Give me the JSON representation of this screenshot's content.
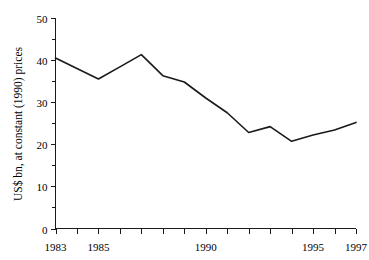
{
  "chart_data": {
    "type": "line",
    "title": "",
    "xlabel": "",
    "ylabel": "US$ bn, at constant (1990) prices",
    "x": [
      1983,
      1984,
      1985,
      1986,
      1987,
      1988,
      1989,
      1990,
      1991,
      1992,
      1993,
      1994,
      1995,
      1996,
      1997
    ],
    "values": [
      40.5,
      38.0,
      35.5,
      38.4,
      41.3,
      36.3,
      34.8,
      31.0,
      27.5,
      22.8,
      24.2,
      20.7,
      22.2,
      23.4,
      25.2
    ],
    "series": [
      {
        "name": "US$ bn, at constant (1990) prices",
        "values": [
          40.5,
          38.0,
          35.5,
          38.4,
          41.3,
          36.3,
          34.8,
          31.0,
          27.5,
          22.8,
          24.2,
          20.7,
          22.2,
          23.4,
          25.2
        ]
      }
    ],
    "xlim": [
      1983,
      1997
    ],
    "ylim": [
      0,
      50
    ],
    "x_tick_labels": [
      "1983",
      "1985",
      "1990",
      "1995",
      "1997"
    ],
    "x_tick_values": [
      1983,
      1985,
      1990,
      1995,
      1997
    ],
    "x_minor_ticks": [
      1983,
      1984,
      1985,
      1986,
      1987,
      1988,
      1989,
      1990,
      1991,
      1992,
      1993,
      1994,
      1995,
      1996,
      1997
    ],
    "y_tick_labels": [
      "0",
      "10",
      "20",
      "30",
      "40",
      "50"
    ],
    "y_tick_values": [
      0,
      10,
      20,
      30,
      40,
      50
    ],
    "y_minor_ticks": [
      5,
      15,
      25,
      35,
      45
    ],
    "grid": false,
    "legend": false,
    "legend_position": "none",
    "line_color": "#1a1a1a",
    "axis_color": "#1a1a1a",
    "background_color": "#ffffff"
  }
}
